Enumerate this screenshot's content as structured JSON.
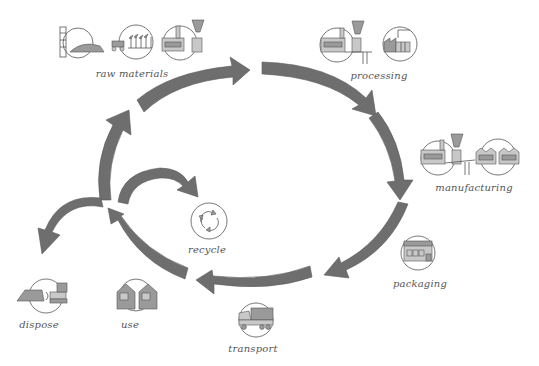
{
  "diagram": {
    "colors": {
      "arrow": "#6e6e6e",
      "icon": "#9a9a9a",
      "text": "#555555",
      "background": "#ffffff"
    },
    "stages": [
      {
        "id": "raw_materials",
        "label": "raw materials",
        "icon": "mine-farm-factory-icon"
      },
      {
        "id": "processing",
        "label": "processing",
        "icon": "processing-plant-icon"
      },
      {
        "id": "manufacturing",
        "label": "manufacturing",
        "icon": "manufacturing-factory-icon"
      },
      {
        "id": "packaging",
        "label": "packaging",
        "icon": "packaging-warehouse-icon"
      },
      {
        "id": "transport",
        "label": "transport",
        "icon": "truck-icon"
      },
      {
        "id": "use",
        "label": "use",
        "icon": "houses-icon"
      },
      {
        "id": "recycle",
        "label": "recycle",
        "icon": "recycle-icon"
      },
      {
        "id": "dispose",
        "label": "dispose",
        "icon": "landfill-bulldozer-icon"
      }
    ],
    "flows": [
      {
        "from": "raw materials",
        "to": "processing"
      },
      {
        "from": "processing",
        "to": "manufacturing"
      },
      {
        "from": "manufacturing",
        "to": "packaging"
      },
      {
        "from": "packaging",
        "to": "transport"
      },
      {
        "from": "transport",
        "to": "use"
      },
      {
        "from": "use",
        "to": "recycle"
      },
      {
        "from": "use",
        "to": "dispose"
      },
      {
        "from": "use",
        "to": "raw materials"
      }
    ]
  }
}
